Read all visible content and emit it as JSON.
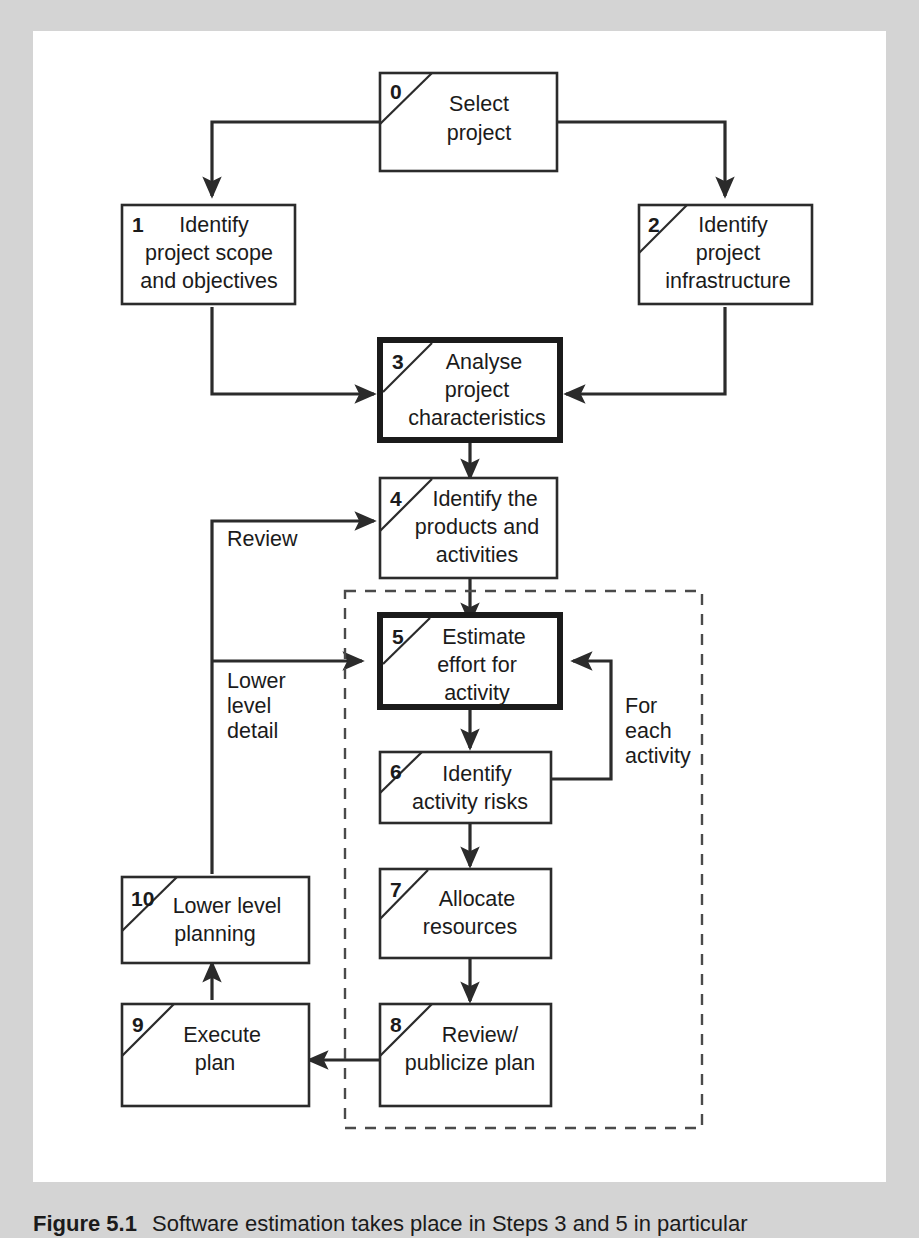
{
  "figure": {
    "caption_number": "Figure 5.1",
    "caption_text": "Software estimation takes place in Steps 3 and 5 in particular",
    "background_color": "#d4d4d4",
    "sheet_color": "#ffffff",
    "line_color": "#2b2b2b"
  },
  "diagram": {
    "type": "flowchart",
    "emphasised_steps": [
      "3",
      "5"
    ],
    "nodes": [
      {
        "id": "0",
        "num": "0",
        "lines": [
          "Select",
          "project"
        ],
        "bold": false,
        "slash": true
      },
      {
        "id": "1",
        "num": "1",
        "lines": [
          "Identify",
          "project scope",
          "and objectives"
        ],
        "bold": false,
        "slash": false
      },
      {
        "id": "2",
        "num": "2",
        "lines": [
          "Identify",
          "project",
          "infrastructure"
        ],
        "bold": false,
        "slash": true
      },
      {
        "id": "3",
        "num": "3",
        "lines": [
          "Analyse",
          "project",
          "characteristics"
        ],
        "bold": true,
        "slash": true
      },
      {
        "id": "4",
        "num": "4",
        "lines": [
          "Identify the",
          "products and",
          "activities"
        ],
        "bold": false,
        "slash": true
      },
      {
        "id": "5",
        "num": "5",
        "lines": [
          "Estimate",
          "effort for",
          "activity"
        ],
        "bold": true,
        "slash": true
      },
      {
        "id": "6",
        "num": "6",
        "lines": [
          "Identify",
          "activity risks"
        ],
        "bold": false,
        "slash": true
      },
      {
        "id": "7",
        "num": "7",
        "lines": [
          "Allocate",
          "resources"
        ],
        "bold": false,
        "slash": true
      },
      {
        "id": "8",
        "num": "8",
        "lines": [
          "Review/",
          "publicize plan"
        ],
        "bold": false,
        "slash": true
      },
      {
        "id": "9",
        "num": "9",
        "lines": [
          "Execute",
          "plan"
        ],
        "bold": false,
        "slash": true
      },
      {
        "id": "10",
        "num": "10",
        "lines": [
          "Lower level",
          "planning"
        ],
        "bold": false,
        "slash": true
      }
    ],
    "edge_labels": [
      {
        "id": "review",
        "lines": [
          "Review"
        ]
      },
      {
        "id": "lower-level",
        "lines": [
          "Lower",
          "level",
          "detail"
        ]
      },
      {
        "id": "for-each",
        "lines": [
          "For",
          "each",
          "activity"
        ]
      }
    ],
    "edges": [
      {
        "from": "0",
        "to": "1",
        "label": ""
      },
      {
        "from": "0",
        "to": "2",
        "label": ""
      },
      {
        "from": "1",
        "to": "3",
        "label": ""
      },
      {
        "from": "2",
        "to": "3",
        "label": ""
      },
      {
        "from": "3",
        "to": "4",
        "label": ""
      },
      {
        "from": "4",
        "to": "5",
        "label": ""
      },
      {
        "from": "5",
        "to": "6",
        "label": ""
      },
      {
        "from": "6",
        "to": "5",
        "label": "For each activity"
      },
      {
        "from": "6",
        "to": "7",
        "label": ""
      },
      {
        "from": "7",
        "to": "8",
        "label": ""
      },
      {
        "from": "8",
        "to": "9",
        "label": ""
      },
      {
        "from": "9",
        "to": "10",
        "label": ""
      },
      {
        "from": "10",
        "to": "4",
        "label": "Review"
      },
      {
        "from": "10",
        "to": "5",
        "label": "Lower level detail"
      }
    ],
    "group_box": {
      "label": "",
      "style": "dashed",
      "contains": [
        "5",
        "6",
        "7",
        "8"
      ]
    }
  }
}
